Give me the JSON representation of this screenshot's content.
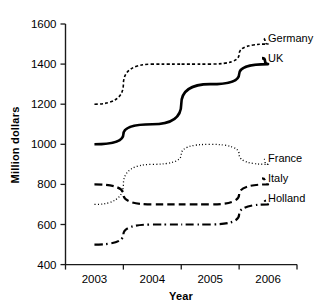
{
  "chart_data": {
    "type": "line",
    "title": "",
    "subtitle": "",
    "xlabel": "Year",
    "ylabel": "Million dollars",
    "categories": [
      "2003",
      "2004",
      "2005",
      "2006"
    ],
    "x": [
      2003,
      2004,
      2005,
      2006
    ],
    "ylim": [
      400,
      1600
    ],
    "y_ticks": [
      400,
      600,
      800,
      1000,
      1200,
      1400,
      1600
    ],
    "y_tick_labels": [
      "400",
      "600",
      "800",
      "1000",
      "1200",
      "1400",
      "1600"
    ],
    "grid": false,
    "legend_position": "right-inline-labels",
    "series": [
      {
        "name": "Germany",
        "values": [
          1200,
          1400,
          1400,
          1500
        ],
        "line_style": "dashed-fine",
        "color": "#000000",
        "width": 1.6
      },
      {
        "name": "UK",
        "values": [
          1000,
          1100,
          1300,
          1400
        ],
        "line_style": "solid",
        "color": "#000000",
        "width": 2.6
      },
      {
        "name": "France",
        "values": [
          700,
          900,
          1000,
          900
        ],
        "line_style": "dotted",
        "color": "#000000",
        "width": 1.3
      },
      {
        "name": "Italy",
        "values": [
          800,
          700,
          700,
          800
        ],
        "line_style": "dashed-long",
        "color": "#000000",
        "width": 2.2
      },
      {
        "name": "Holland",
        "values": [
          500,
          600,
          600,
          700
        ],
        "line_style": "dash-dot",
        "color": "#000000",
        "width": 2.2
      }
    ],
    "axis_color": "#1a1a1a",
    "background": "#ffffff"
  },
  "labels": {
    "y_axis_title": "Million dollars",
    "x_axis_title": "Year",
    "y_ticks": [
      "1600",
      "1400",
      "1200",
      "1000",
      "800",
      "600",
      "400"
    ],
    "x_ticks": [
      "2003",
      "2004",
      "2005",
      "2006"
    ],
    "series_names": [
      "Germany",
      "UK",
      "France",
      "Italy",
      "Holland"
    ]
  }
}
